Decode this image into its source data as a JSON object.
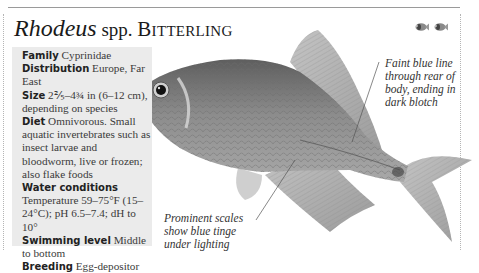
{
  "header": {
    "genus": "Rhodeus",
    "spp": " spp. ",
    "common_name": "Bitterling",
    "badges": [
      "fish-icon",
      "fish-icon"
    ]
  },
  "info": {
    "family": {
      "label": "Family",
      "value": " Cyprinidae"
    },
    "distribution": {
      "label": "Distribution",
      "value": " Europe, Far East"
    },
    "size": {
      "label": "Size",
      "value": " 2⅖–4¾ in (6–12 cm), depending on species"
    },
    "diet": {
      "label": "Diet",
      "value": " Omnivorous. Small aquatic invertebrates such as insect larvae and bloodworm, live or frozen; also flake foods"
    },
    "water": {
      "label": "Water conditions",
      "value": "Temperature 59–75°F (15–24°C); pH 6.5–7.4; dH to 10°"
    },
    "swimming": {
      "label": "Swimming level",
      "value": " Middle to bottom"
    },
    "breeding": {
      "label": "Breeding",
      "value": " Egg-depositor"
    }
  },
  "callouts": {
    "rear": "Faint blue line through rear of body, ending in dark blotch",
    "scales": "Prominent scales show blue tinge under lighting"
  },
  "colors": {
    "box_bg": "#ebebeb",
    "text": "#2a2a2a",
    "rule": "#9a9a9a"
  }
}
